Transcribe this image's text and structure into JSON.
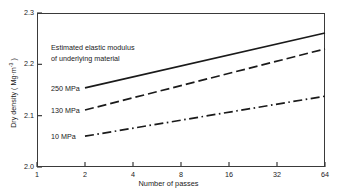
{
  "chart_data": {
    "type": "line",
    "title": "",
    "xlabel": "Number of passes",
    "ylabel": "Dry density ( Mg·m",
    "ylabel_sup": "-3",
    "ylabel_tail": " )",
    "xscale": "log2",
    "xlim": [
      1,
      64
    ],
    "ylim": [
      2.0,
      2.3
    ],
    "xticks": [
      "1",
      "2",
      "4",
      "8",
      "16",
      "32",
      "64"
    ],
    "xtick_values": [
      1,
      2,
      4,
      8,
      16,
      32,
      64
    ],
    "yticks": [
      "2.0",
      "2.1",
      "2.2",
      "2.3"
    ],
    "ytick_values": [
      2.0,
      2.1,
      2.2,
      2.3
    ],
    "grid": false,
    "legend": "inline-labels",
    "annotation": {
      "line1": "Estimated elastic modulus",
      "line2": "of underlying material"
    },
    "series": [
      {
        "name": "250 MPa",
        "label": "250 MPa",
        "style": "solid",
        "x": [
          2,
          64
        ],
        "values": [
          2.154,
          2.261
        ]
      },
      {
        "name": "130 MPa",
        "label": "130 MPa",
        "style": "dashed",
        "x": [
          2,
          64
        ],
        "values": [
          2.111,
          2.23
        ]
      },
      {
        "name": "10 MPa",
        "label": "10 MPa",
        "style": "dash-dot",
        "x": [
          2,
          64
        ],
        "values": [
          2.06,
          2.138
        ]
      }
    ],
    "colors": {
      "line": "#1a1a1a",
      "axis": "#3a3a3a",
      "background": "#ffffff"
    }
  }
}
